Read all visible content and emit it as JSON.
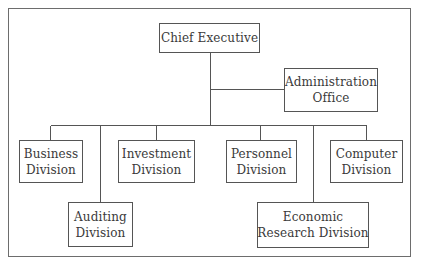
{
  "diagram": {
    "type": "org-chart",
    "colors": {
      "line": "#555555",
      "frame": "#6d6d6d",
      "text": "#3a3a3a",
      "background": "#ffffff"
    },
    "root": {
      "id": "chief-executive",
      "lines": [
        "Chief Executive"
      ]
    },
    "staff": {
      "id": "administration-office",
      "lines": [
        "Administration",
        "Office"
      ]
    },
    "divisions": [
      {
        "id": "business-division",
        "lines": [
          "Business",
          "Division"
        ],
        "row": 1
      },
      {
        "id": "auditing-division",
        "lines": [
          "Auditing",
          "Division"
        ],
        "row": 2
      },
      {
        "id": "investment-division",
        "lines": [
          "Investment",
          "Division"
        ],
        "row": 1
      },
      {
        "id": "personnel-division",
        "lines": [
          "Personnel",
          "Division"
        ],
        "row": 1
      },
      {
        "id": "economic-research-division",
        "lines": [
          "Economic",
          "Research Division"
        ],
        "row": 2
      },
      {
        "id": "computer-division",
        "lines": [
          "Computer",
          "Division"
        ],
        "row": 1
      }
    ],
    "edges": [
      [
        "Chief Executive",
        "Administration Office"
      ],
      [
        "Chief Executive",
        "Business Division"
      ],
      [
        "Chief Executive",
        "Auditing Division"
      ],
      [
        "Chief Executive",
        "Investment Division"
      ],
      [
        "Chief Executive",
        "Personnel Division"
      ],
      [
        "Chief Executive",
        "Economic Research Division"
      ],
      [
        "Chief Executive",
        "Computer Division"
      ]
    ]
  }
}
